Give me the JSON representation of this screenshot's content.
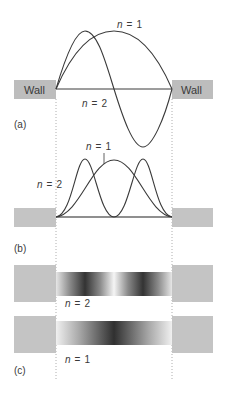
{
  "panels": {
    "a": {
      "label": "(a)",
      "wall_left_label": "Wall",
      "wall_right_label": "Wall",
      "curve_labels": [
        {
          "n": "n",
          "eq": "=",
          "value": "1"
        },
        {
          "n": "n",
          "eq": "=",
          "value": "2"
        }
      ],
      "description": "Standing wave amplitudes psi for n=1 and n=2 between walls"
    },
    "b": {
      "label": "(b)",
      "curve_labels": [
        {
          "n": "n",
          "eq": "=",
          "value": "1"
        },
        {
          "n": "n",
          "eq": "=",
          "value": "2"
        }
      ],
      "description": "Probability densities psi^2 for n=1 and n=2"
    },
    "c": {
      "label": "(c)",
      "bar_labels": [
        {
          "n": "n",
          "eq": "=",
          "value": "2"
        },
        {
          "n": "n",
          "eq": "=",
          "value": "1"
        }
      ],
      "description": "Shaded probability density bars for n=2 (top) and n=1 (bottom)"
    }
  },
  "colors": {
    "wall": "#bdbdbd",
    "curve": "#3a3a3a",
    "bar_dark": "#2f2f2f",
    "bar_light": "#f4f4f4",
    "guide": "#9a9a9a"
  }
}
